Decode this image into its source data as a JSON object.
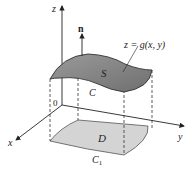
{
  "diagram": {
    "labels": {
      "z_axis": "z",
      "x_axis": "x",
      "y_axis": "y",
      "origin": "0",
      "normal": "n",
      "surface": "S",
      "surface_eq": "z = g(x, y)",
      "boundary": "C",
      "region": "D",
      "region_boundary": "C",
      "region_boundary_sub": "1"
    },
    "colors": {
      "surface_fill": "#8a8a8a",
      "region_fill": "#d4d4d4",
      "line": "#222222"
    }
  }
}
